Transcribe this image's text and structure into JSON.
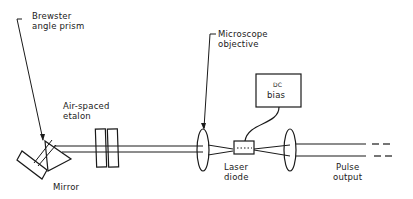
{
  "diagram": {
    "type": "optical-setup",
    "labels": {
      "prism": [
        "Brewster",
        "angle prism"
      ],
      "etalon": [
        "Air-spaced",
        "etalon"
      ],
      "mirror": "Mirror",
      "objective": [
        "Microscope",
        "objective"
      ],
      "bias": [
        "DC",
        "bias"
      ],
      "laser": [
        "Laser",
        "diode"
      ],
      "output": [
        "Pulse",
        "output"
      ]
    },
    "components": [
      {
        "id": "mirror",
        "name": "Mirror"
      },
      {
        "id": "prism",
        "name": "Brewster angle prism"
      },
      {
        "id": "etalon",
        "name": "Air-spaced etalon"
      },
      {
        "id": "objective-1",
        "name": "Microscope objective"
      },
      {
        "id": "laser-diode",
        "name": "Laser diode"
      },
      {
        "id": "dc-bias",
        "name": "DC bias"
      },
      {
        "id": "objective-2",
        "name": "Output lens"
      },
      {
        "id": "output",
        "name": "Pulse output"
      }
    ],
    "line_color": "#1a1a1a",
    "background": "#ffffff"
  }
}
